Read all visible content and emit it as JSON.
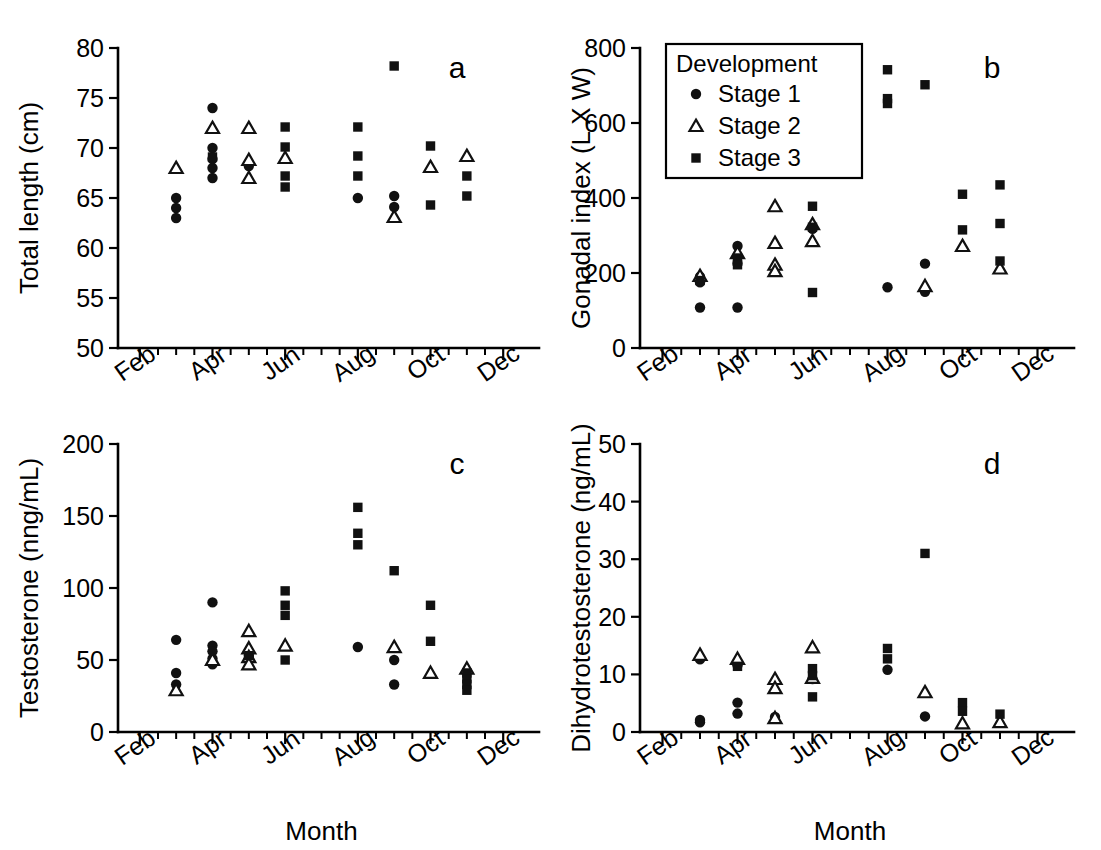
{
  "figure": {
    "width": 1101,
    "height": 850,
    "background": "#ffffff",
    "ink_color": "#111111"
  },
  "legend": {
    "title": "Development",
    "position": "panel-b-top-left",
    "entries": [
      {
        "marker": "circle-filled",
        "label": "Stage 1"
      },
      {
        "marker": "triangle-open",
        "label": "Stage 2"
      },
      {
        "marker": "square-filled",
        "label": "Stage 3"
      }
    ]
  },
  "axis": {
    "x_label": "Month",
    "x_tick_labels": [
      "Feb",
      "Apr",
      "Jun",
      "Aug",
      "Oct",
      "Dec"
    ],
    "x_tick_values": [
      2,
      4,
      6,
      8,
      10,
      12
    ],
    "x_minor_step": 0.5,
    "x_range": [
      1.4,
      12.6
    ],
    "x_label_rotation_deg": -35
  },
  "chart_data": [
    {
      "type": "scatter",
      "panel": "a",
      "title": "a",
      "xlabel": "",
      "ylabel": "Total length (cm)",
      "ylim": [
        50,
        80
      ],
      "yticks": [
        50,
        55,
        60,
        65,
        70,
        75,
        80
      ],
      "xlim": [
        1.4,
        12.6
      ],
      "xticks": [
        2,
        4,
        6,
        8,
        10,
        12
      ],
      "xticklabels": [
        "Feb",
        "Apr",
        "Jun",
        "Aug",
        "Oct",
        "Dec"
      ],
      "grid": false,
      "legend": false,
      "series": [
        {
          "name": "Stage 1",
          "marker": "circle-filled",
          "points": [
            [
              3.0,
              65.0
            ],
            [
              3.0,
              64.0
            ],
            [
              3.0,
              63.0
            ],
            [
              4.0,
              74.0
            ],
            [
              4.0,
              70.0
            ],
            [
              4.0,
              68.9
            ],
            [
              4.0,
              68.0
            ],
            [
              4.0,
              67.0
            ],
            [
              5.0,
              68.2
            ],
            [
              8.0,
              65.0
            ],
            [
              9.0,
              65.2
            ],
            [
              9.0,
              64.1
            ]
          ]
        },
        {
          "name": "Stage 2",
          "marker": "triangle-open",
          "points": [
            [
              3.0,
              68.0
            ],
            [
              4.0,
              72.0
            ],
            [
              5.0,
              72.0
            ],
            [
              5.0,
              68.8
            ],
            [
              5.0,
              67.0
            ],
            [
              6.0,
              69.0
            ],
            [
              9.0,
              63.1
            ],
            [
              10.0,
              68.1
            ],
            [
              11.0,
              69.2
            ]
          ]
        },
        {
          "name": "Stage 3",
          "marker": "square-filled",
          "points": [
            [
              4.0,
              69.1
            ],
            [
              6.0,
              72.1
            ],
            [
              6.0,
              70.1
            ],
            [
              6.0,
              67.2
            ],
            [
              6.0,
              66.1
            ],
            [
              8.0,
              72.1
            ],
            [
              8.0,
              69.2
            ],
            [
              8.0,
              67.2
            ],
            [
              9.0,
              78.2
            ],
            [
              10.0,
              70.2
            ],
            [
              10.0,
              64.3
            ],
            [
              11.0,
              67.2
            ],
            [
              11.0,
              65.2
            ]
          ]
        }
      ]
    },
    {
      "type": "scatter",
      "panel": "b",
      "title": "b",
      "xlabel": "",
      "ylabel": "Gonadal index (L X W)",
      "ylim": [
        0,
        800
      ],
      "yticks": [
        0,
        200,
        400,
        600,
        800
      ],
      "xlim": [
        1.4,
        12.6
      ],
      "xticks": [
        2,
        4,
        6,
        8,
        10,
        12
      ],
      "xticklabels": [
        "Feb",
        "Apr",
        "Jun",
        "Aug",
        "Oct",
        "Dec"
      ],
      "grid": false,
      "legend": true,
      "series": [
        {
          "name": "Stage 1",
          "marker": "circle-filled",
          "points": [
            [
              3.0,
              190
            ],
            [
              3.0,
              175
            ],
            [
              3.0,
              108
            ],
            [
              4.0,
              272
            ],
            [
              4.0,
              225
            ],
            [
              4.0,
              108
            ],
            [
              6.0,
              318
            ],
            [
              8.0,
              162
            ],
            [
              9.0,
              225
            ],
            [
              9.0,
              150
            ]
          ]
        },
        {
          "name": "Stage 2",
          "marker": "triangle-open",
          "points": [
            [
              3.0,
              192
            ],
            [
              4.0,
              253
            ],
            [
              5.0,
              378
            ],
            [
              5.0,
              280
            ],
            [
              5.0,
              222
            ],
            [
              5.0,
              205
            ],
            [
              6.0,
              330
            ],
            [
              6.0,
              285
            ],
            [
              9.0,
              165
            ],
            [
              10.0,
              272
            ],
            [
              11.0,
              212
            ]
          ]
        },
        {
          "name": "Stage 3",
          "marker": "square-filled",
          "points": [
            [
              3.0,
              180
            ],
            [
              4.0,
              240
            ],
            [
              4.0,
              222
            ],
            [
              6.0,
              378
            ],
            [
              6.0,
              322
            ],
            [
              6.0,
              148
            ],
            [
              8.0,
              742
            ],
            [
              8.0,
              665
            ],
            [
              8.0,
              652
            ],
            [
              9.0,
              702
            ],
            [
              10.0,
              410
            ],
            [
              10.0,
              315
            ],
            [
              11.0,
              435
            ],
            [
              11.0,
              332
            ],
            [
              11.0,
              232
            ]
          ]
        }
      ]
    },
    {
      "type": "scatter",
      "panel": "c",
      "title": "c",
      "xlabel": "Month",
      "ylabel": "Testosterone (nng/mL)",
      "ylim": [
        0,
        200
      ],
      "yticks": [
        0,
        50,
        100,
        150,
        200
      ],
      "xlim": [
        1.4,
        12.6
      ],
      "xticks": [
        2,
        4,
        6,
        8,
        10,
        12
      ],
      "xticklabels": [
        "Feb",
        "Apr",
        "Jun",
        "Aug",
        "Oct",
        "Dec"
      ],
      "grid": false,
      "legend": false,
      "series": [
        {
          "name": "Stage 1",
          "marker": "circle-filled",
          "points": [
            [
              3.0,
              64
            ],
            [
              3.0,
              41
            ],
            [
              3.0,
              33
            ],
            [
              4.0,
              90
            ],
            [
              4.0,
              60
            ],
            [
              4.0,
              56
            ],
            [
              4.0,
              51
            ],
            [
              4.0,
              47
            ],
            [
              5.0,
              53
            ],
            [
              5.0,
              51
            ],
            [
              8.0,
              59
            ],
            [
              9.0,
              50
            ],
            [
              9.0,
              33
            ]
          ]
        },
        {
          "name": "Stage 2",
          "marker": "triangle-open",
          "points": [
            [
              3.0,
              29
            ],
            [
              4.0,
              50
            ],
            [
              5.0,
              70
            ],
            [
              5.0,
              58
            ],
            [
              5.0,
              52
            ],
            [
              5.0,
              47
            ],
            [
              6.0,
              60
            ],
            [
              9.0,
              59
            ],
            [
              10.0,
              41
            ],
            [
              11.0,
              44
            ]
          ]
        },
        {
          "name": "Stage 3",
          "marker": "square-filled",
          "points": [
            [
              5.0,
              53
            ],
            [
              6.0,
              98
            ],
            [
              6.0,
              88
            ],
            [
              6.0,
              81
            ],
            [
              6.0,
              50
            ],
            [
              8.0,
              156
            ],
            [
              8.0,
              138
            ],
            [
              8.0,
              130
            ],
            [
              9.0,
              112
            ],
            [
              10.0,
              88
            ],
            [
              10.0,
              63
            ],
            [
              11.0,
              41
            ],
            [
              11.0,
              37
            ],
            [
              11.0,
              33
            ],
            [
              11.0,
              29
            ]
          ]
        }
      ]
    },
    {
      "type": "scatter",
      "panel": "d",
      "title": "d",
      "xlabel": "Month",
      "ylabel": "Dihydrotestosterone (ng/mL)",
      "ylim": [
        0,
        50
      ],
      "yticks": [
        0,
        10,
        20,
        30,
        40,
        50
      ],
      "xlim": [
        1.4,
        12.6
      ],
      "xticks": [
        2,
        4,
        6,
        8,
        10,
        12
      ],
      "xticklabels": [
        "Feb",
        "Apr",
        "Jun",
        "Aug",
        "Oct",
        "Dec"
      ],
      "grid": false,
      "legend": false,
      "series": [
        {
          "name": "Stage 1",
          "marker": "circle-filled",
          "points": [
            [
              3.0,
              12.6
            ],
            [
              3.0,
              2.1
            ],
            [
              3.0,
              1.7
            ],
            [
              4.0,
              11.6
            ],
            [
              4.0,
              5.1
            ],
            [
              4.0,
              3.2
            ],
            [
              5.0,
              2.6
            ],
            [
              6.0,
              9.2
            ],
            [
              8.0,
              10.8
            ],
            [
              9.0,
              2.7
            ]
          ]
        },
        {
          "name": "Stage 2",
          "marker": "triangle-open",
          "points": [
            [
              3.0,
              13.4
            ],
            [
              4.0,
              12.7
            ],
            [
              5.0,
              9.2
            ],
            [
              5.0,
              7.6
            ],
            [
              5.0,
              2.4
            ],
            [
              6.0,
              14.7
            ],
            [
              6.0,
              9.4
            ],
            [
              9.0,
              6.9
            ],
            [
              10.0,
              1.5
            ],
            [
              11.0,
              1.7
            ]
          ]
        },
        {
          "name": "Stage 3",
          "marker": "square-filled",
          "points": [
            [
              4.0,
              11.4
            ],
            [
              6.0,
              11.0
            ],
            [
              6.0,
              9.8
            ],
            [
              6.0,
              6.1
            ],
            [
              8.0,
              14.5
            ],
            [
              8.0,
              12.7
            ],
            [
              9.0,
              31.0
            ],
            [
              10.0,
              5.1
            ],
            [
              10.0,
              3.6
            ],
            [
              11.0,
              3.1
            ]
          ]
        }
      ]
    }
  ]
}
